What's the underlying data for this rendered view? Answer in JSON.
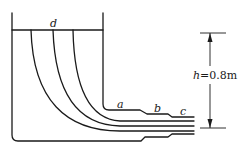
{
  "diagram": {
    "type": "fluid-flow-tank-with-outlet-pipe",
    "labels": {
      "surface": "d",
      "section_a": "a",
      "section_b": "b",
      "section_c": "c",
      "head_var": "h",
      "head_value": "=0.8m"
    },
    "colors": {
      "line": "#1a1a1a",
      "background": "#ffffff"
    }
  }
}
